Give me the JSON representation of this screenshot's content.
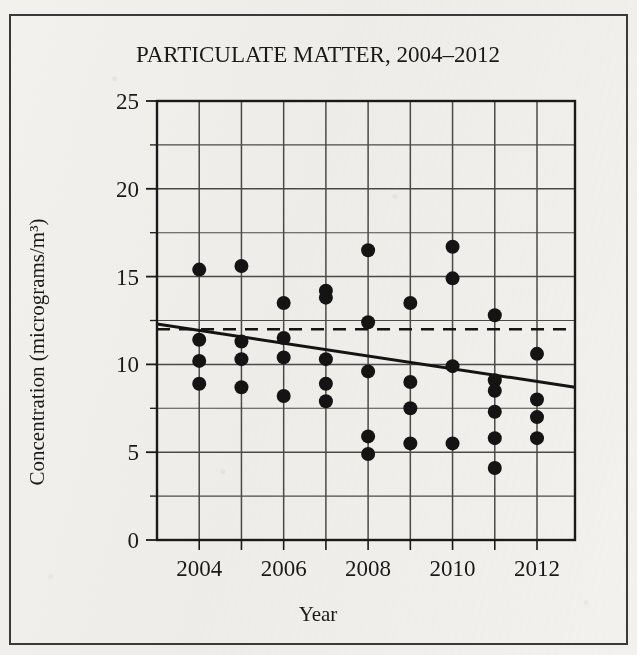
{
  "figure": {
    "title": "PARTICULATE MATTER, 2004–2012",
    "frame_color": "#3a3a3a",
    "background_color": "#f2f1ee",
    "ink_color": "#1a1a1a"
  },
  "chart_data": {
    "type": "scatter",
    "title": "PARTICULATE MATTER, 2004–2012",
    "xlabel": "Year",
    "ylabel": "Concentration (micrograms/m³)",
    "xlim": [
      2003.0,
      2012.9
    ],
    "ylim": [
      0,
      25
    ],
    "grid": true,
    "legend": "none",
    "y_ticks": [
      0,
      5,
      10,
      15,
      20,
      25
    ],
    "y_tick_labels": [
      "0",
      "5",
      "10",
      "15",
      "20",
      "25"
    ],
    "y_minor_tick_step": 2.5,
    "x_ticks": [
      2004,
      2006,
      2008,
      2010,
      2012
    ],
    "x_tick_labels": [
      "2004",
      "2006",
      "2008",
      "2010",
      "2012"
    ],
    "x_gridline_years": [
      2004,
      2005,
      2006,
      2007,
      2008,
      2009,
      2010,
      2011,
      2012
    ],
    "marker": "filled-circle",
    "marker_color": "#141414",
    "marker_radius_px": 7,
    "points": [
      {
        "x": 2004,
        "y": 15.4
      },
      {
        "x": 2004,
        "y": 11.4
      },
      {
        "x": 2004,
        "y": 10.2
      },
      {
        "x": 2004,
        "y": 8.9
      },
      {
        "x": 2005,
        "y": 15.6
      },
      {
        "x": 2005,
        "y": 11.3
      },
      {
        "x": 2005,
        "y": 10.3
      },
      {
        "x": 2005,
        "y": 8.7
      },
      {
        "x": 2006,
        "y": 13.5
      },
      {
        "x": 2006,
        "y": 11.5
      },
      {
        "x": 2006,
        "y": 10.4
      },
      {
        "x": 2006,
        "y": 8.2
      },
      {
        "x": 2007,
        "y": 14.2
      },
      {
        "x": 2007,
        "y": 13.8
      },
      {
        "x": 2007,
        "y": 10.3
      },
      {
        "x": 2007,
        "y": 8.9
      },
      {
        "x": 2007,
        "y": 7.9
      },
      {
        "x": 2008,
        "y": 16.5
      },
      {
        "x": 2008,
        "y": 12.4
      },
      {
        "x": 2008,
        "y": 9.6
      },
      {
        "x": 2008,
        "y": 5.9
      },
      {
        "x": 2008,
        "y": 4.9
      },
      {
        "x": 2009,
        "y": 13.5
      },
      {
        "x": 2009,
        "y": 9.0
      },
      {
        "x": 2009,
        "y": 7.5
      },
      {
        "x": 2009,
        "y": 5.5
      },
      {
        "x": 2010,
        "y": 16.7
      },
      {
        "x": 2010,
        "y": 14.9
      },
      {
        "x": 2010,
        "y": 9.9
      },
      {
        "x": 2010,
        "y": 5.5
      },
      {
        "x": 2011,
        "y": 12.8
      },
      {
        "x": 2011,
        "y": 9.1
      },
      {
        "x": 2011,
        "y": 8.5
      },
      {
        "x": 2011,
        "y": 7.3
      },
      {
        "x": 2011,
        "y": 5.8
      },
      {
        "x": 2011,
        "y": 4.1
      },
      {
        "x": 2012,
        "y": 10.6
      },
      {
        "x": 2012,
        "y": 8.0
      },
      {
        "x": 2012,
        "y": 7.0
      },
      {
        "x": 2012,
        "y": 5.8
      }
    ],
    "trend_line": {
      "name": "trend-line",
      "style": "solid",
      "color": "#141414",
      "x_start": 2003.0,
      "y_start": 12.3,
      "x_end": 2012.9,
      "y_end": 8.7
    },
    "reference_line": {
      "name": "reference-line",
      "style": "dashed",
      "color": "#141414",
      "y": 12.0,
      "x_start": 2003.0,
      "x_end": 2012.9
    }
  }
}
